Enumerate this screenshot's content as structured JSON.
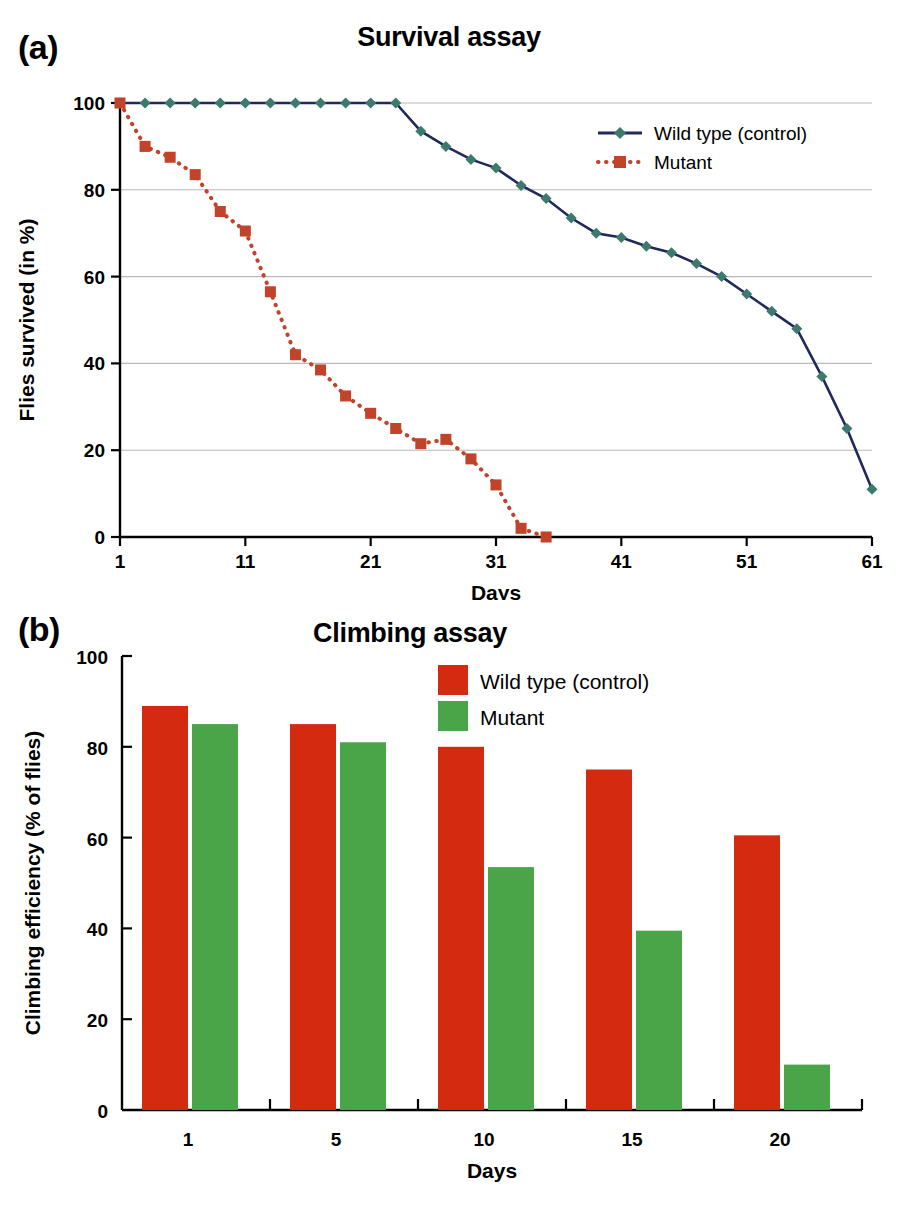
{
  "figure": {
    "panel_a_letter": "(a)",
    "panel_b_letter": "(b)"
  },
  "chart_data": [
    {
      "id": "survival-assay",
      "type": "line",
      "title": "Survival assay",
      "xlabel": "Days",
      "ylabel": "Flies survived (in %)",
      "xlim": [
        1,
        61
      ],
      "ylim": [
        0,
        100
      ],
      "xticks": [
        1,
        11,
        21,
        31,
        41,
        51,
        61
      ],
      "yticks": [
        0,
        20,
        40,
        60,
        80,
        100
      ],
      "grid": "horizontal",
      "legend_position": "top-right",
      "series": [
        {
          "name": "Wild type (control)",
          "color": "#3d7a6e",
          "line_color": "#1f2a5a",
          "line_style": "solid",
          "marker": "diamond",
          "x": [
            1,
            3,
            5,
            7,
            9,
            11,
            13,
            15,
            17,
            19,
            21,
            23,
            25,
            27,
            29,
            31,
            33,
            35,
            37,
            39,
            41,
            43,
            45,
            47,
            49,
            51,
            53,
            55,
            57,
            59,
            61
          ],
          "y": [
            100,
            100,
            100,
            100,
            100,
            100,
            100,
            100,
            100,
            100,
            100,
            100,
            93.5,
            90,
            87,
            85,
            81,
            78,
            73.5,
            70,
            69,
            67,
            65.5,
            63,
            60,
            56,
            52,
            48,
            37,
            25,
            11,
            0
          ]
        },
        {
          "name": "Mutant",
          "color": "#c0432a",
          "line_color": "#c0432a",
          "line_style": "dotted",
          "marker": "square",
          "x": [
            1,
            3,
            5,
            7,
            9,
            11,
            13,
            15,
            17,
            19,
            21,
            23,
            25,
            27,
            29,
            31,
            33,
            35
          ],
          "y": [
            100,
            90,
            87.5,
            83.5,
            75,
            70.5,
            56.5,
            42,
            38.5,
            32.5,
            28.5,
            25,
            21.5,
            22.5,
            18,
            12,
            2,
            0
          ]
        }
      ]
    },
    {
      "id": "climbing-assay",
      "type": "bar",
      "title": "Climbing assay",
      "xlabel": "Days",
      "ylabel": "Climbing efficiency (% of flies)",
      "ylim": [
        0,
        100
      ],
      "yticks": [
        0,
        20,
        40,
        60,
        80,
        100
      ],
      "categories": [
        "1",
        "5",
        "10",
        "15",
        "20"
      ],
      "grid": "none",
      "legend_position": "top-right",
      "series": [
        {
          "name": "Wild type (control)",
          "color": "#d42a10",
          "values": [
            89,
            85,
            80,
            75,
            60.5
          ]
        },
        {
          "name": "Mutant",
          "color": "#4aa548",
          "values": [
            85,
            81,
            53.5,
            39.5,
            10
          ]
        }
      ]
    }
  ]
}
